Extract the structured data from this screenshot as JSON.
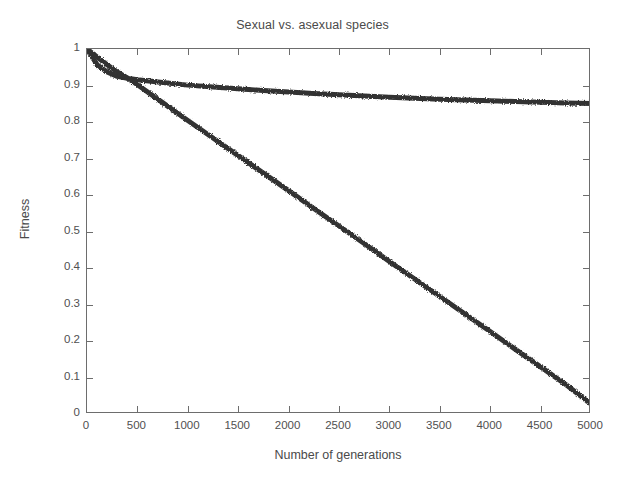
{
  "chart_data": {
    "type": "line",
    "title": "Sexual vs. asexual species",
    "xlabel": "Number of generations",
    "ylabel": "Fitness",
    "xlim": [
      0,
      5000
    ],
    "ylim": [
      0,
      1
    ],
    "grid": false,
    "legend_position": "none",
    "xticks": [
      0,
      500,
      1000,
      1500,
      2000,
      2500,
      3000,
      3500,
      4000,
      4500,
      5000
    ],
    "xtick_labels": [
      "0",
      "500",
      "1000",
      "1500",
      "2000",
      "2500",
      "3000",
      "3500",
      "4000",
      "4500",
      "5000"
    ],
    "yticks": [
      0,
      0.1,
      0.2,
      0.3,
      0.4,
      0.5,
      0.6,
      0.7,
      0.8,
      0.9,
      1
    ],
    "ytick_labels": [
      "0",
      "0.1",
      "0.2",
      "0.3",
      "0.4",
      "0.5",
      "0.6",
      "0.7",
      "0.8",
      "0.9",
      "1"
    ],
    "line_color": "#333333",
    "line_width": 5,
    "x": [
      0,
      100,
      200,
      300,
      400,
      500,
      750,
      1000,
      1250,
      1500,
      1750,
      2000,
      2250,
      2500,
      2750,
      3000,
      3250,
      3500,
      3750,
      4000,
      4250,
      4500,
      4750,
      5000
    ],
    "series": [
      {
        "name": "Sexual species",
        "values": [
          1.0,
          0.957,
          0.937,
          0.925,
          0.92,
          0.916,
          0.908,
          0.901,
          0.896,
          0.891,
          0.886,
          0.882,
          0.878,
          0.875,
          0.871,
          0.868,
          0.865,
          0.862,
          0.86,
          0.858,
          0.856,
          0.854,
          0.852,
          0.851
        ]
      },
      {
        "name": "Asexual species",
        "values": [
          1.0,
          0.978,
          0.957,
          0.937,
          0.921,
          0.902,
          0.853,
          0.804,
          0.756,
          0.708,
          0.66,
          0.612,
          0.563,
          0.515,
          0.467,
          0.418,
          0.37,
          0.322,
          0.274,
          0.226,
          0.177,
          0.129,
          0.081,
          0.027
        ]
      }
    ]
  }
}
